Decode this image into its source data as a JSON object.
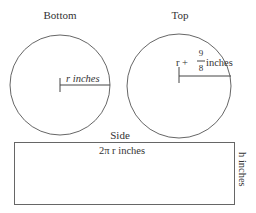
{
  "bottom": {
    "title": "Bottom",
    "radius_label": "r inches"
  },
  "top": {
    "title": "Top",
    "radius_label_prefix": "r +",
    "fraction_numerator": "9",
    "fraction_denominator": "8",
    "radius_label_suffix": "inches"
  },
  "side": {
    "title": "Side",
    "width_label": "2π r inches",
    "height_label": "h inches"
  }
}
